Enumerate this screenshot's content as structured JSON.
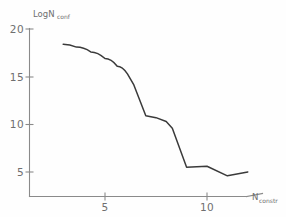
{
  "chart_data": {
    "type": "line",
    "title": "",
    "xlabel": "N_constr",
    "ylabel": "LogN_conf",
    "ylabel_main": "LogN",
    "ylabel_sub": "conf",
    "xlabel_main": "N",
    "xlabel_sub": "constr",
    "xlim": [
      2.0,
      12.6
    ],
    "ylim": [
      2.8,
      20.5
    ],
    "grid": false,
    "legend": null,
    "xticks": [
      5,
      10
    ],
    "xtick_labels": [
      "5",
      "10"
    ],
    "yticks": [
      5,
      10,
      15,
      20
    ],
    "ytick_labels": [
      "5",
      "10",
      "15",
      "20"
    ],
    "series": [
      {
        "name": "LogN_conf vs N_constr",
        "color": "#3a3a3a",
        "x": [
          2.95,
          3.6,
          4.3,
          5.0,
          5.6,
          6.1,
          6.4,
          7.0,
          7.5,
          8.0,
          8.3,
          9.0,
          10.0,
          11.0,
          12.0
        ],
        "y": [
          18.4,
          18.1,
          17.6,
          16.9,
          16.1,
          15.3,
          14.2,
          10.9,
          10.7,
          10.3,
          9.6,
          5.5,
          5.6,
          4.6,
          5.0
        ]
      }
    ],
    "annotations": []
  },
  "axes": {
    "y_axis_name": "vertical-axis",
    "x_axis_name": "horizontal-axis"
  }
}
